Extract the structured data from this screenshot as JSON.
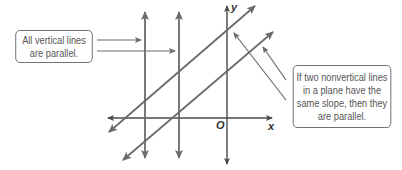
{
  "diagram": {
    "axes": {
      "x_label": "x",
      "y_label": "y",
      "origin_label": "O"
    },
    "callouts": {
      "vertical": {
        "lines": [
          "All vertical lines",
          "are parallel."
        ]
      },
      "nonvertical": {
        "lines": [
          "If two nonvertical lines",
          "in a plane have the",
          "same slope, then they",
          "are parallel."
        ]
      }
    },
    "elements": [
      {
        "type": "vertical-line",
        "count": 2
      },
      {
        "type": "parallel-nonvertical-line",
        "count": 2,
        "slope": "positive, equal"
      },
      {
        "type": "x-axis"
      },
      {
        "type": "y-axis"
      }
    ],
    "colors": {
      "line": "#6b6b6b",
      "axis": "#4a4a4a",
      "text": "#555555",
      "box_border": "#6a6a6a"
    }
  }
}
